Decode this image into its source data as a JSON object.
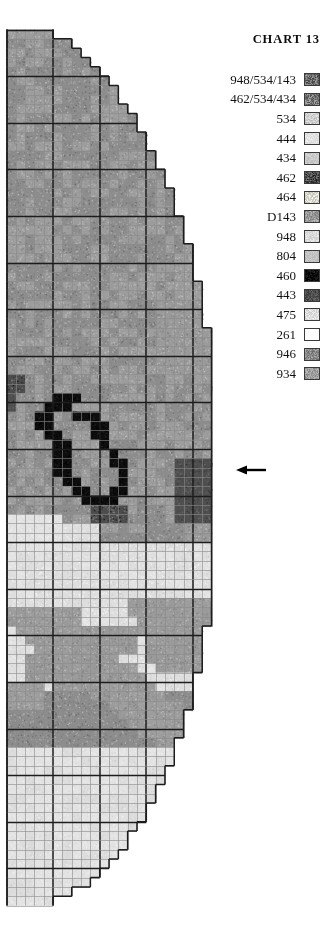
{
  "header": {
    "title": "CHART 13"
  },
  "legend": {
    "items": [
      {
        "label": "948/534/143",
        "color": "#6f6f6f",
        "noise": 0.42
      },
      {
        "label": "462/534/434",
        "color": "#7e7e7e",
        "noise": 0.4
      },
      {
        "label": "534",
        "color": "#cfcfcf",
        "noise": 0.22
      },
      {
        "label": "444",
        "color": "#e3e3e3",
        "noise": 0.1
      },
      {
        "label": "434",
        "color": "#c9c9c9",
        "noise": 0.12
      },
      {
        "label": "462",
        "color": "#4c4c4c",
        "noise": 0.42
      },
      {
        "label": "464",
        "color": "#d8d8cf",
        "noise": 0.26
      },
      {
        "label": "D143",
        "color": "#9a9a9a",
        "noise": 0.26
      },
      {
        "label": "948",
        "color": "#dcdcdc",
        "noise": 0.12
      },
      {
        "label": "804",
        "color": "#c2c2c2",
        "noise": 0.1
      },
      {
        "label": "460",
        "color": "#0d0d0d",
        "noise": 0.18
      },
      {
        "label": "443",
        "color": "#4f4f4f",
        "noise": 0.22
      },
      {
        "label": "475",
        "color": "#dedede",
        "noise": 0.16
      },
      {
        "label": "261",
        "color": "#ffffff",
        "noise": 0.0
      },
      {
        "label": "946",
        "color": "#8d8d8d",
        "noise": 0.3
      },
      {
        "label": "934",
        "color": "#9d9d9d",
        "noise": 0.24
      }
    ]
  },
  "annotation": {
    "arrow": {
      "name": "row-marker-arrow",
      "x": 236,
      "y": 470,
      "length": 30
    }
  },
  "chart_data": {
    "type": "heatmap",
    "title": "CHART 13",
    "grid": {
      "origin_x": 6.5,
      "origin_y": 29.5,
      "cell": 9.32,
      "cols": 22,
      "rows": 94,
      "major_every": 5,
      "cell_line_color": "#8a8a8a",
      "major_line_color": "#1c1c1c",
      "cell_line_width": 0.6,
      "major_line_width": 1.5
    },
    "xlabel": "",
    "ylabel": "",
    "legend_position": "top-right",
    "symbols": [
      "948/534/143",
      "462/534/434",
      "534",
      "444",
      "434",
      "462",
      "464",
      "D143",
      "948",
      "804",
      "460",
      "443",
      "475",
      "261",
      "946",
      "934"
    ],
    "palette": [
      "#6f6f6f",
      "#7e7e7e",
      "#cfcfcf",
      "#e3e3e3",
      "#c9c9c9",
      "#4c4c4c",
      "#d8d8cf",
      "#9a9a9a",
      "#dcdcdc",
      "#c2c2c2",
      "#0d0d0d",
      "#4f4f4f",
      "#dedede",
      "#ffffff",
      "#8d8d8d",
      "#9d9d9d"
    ],
    "right_edge_cols": [
      4,
      6,
      7,
      8,
      9,
      10,
      11,
      11,
      12,
      13,
      13,
      14,
      14,
      15,
      15,
      16,
      16,
      17,
      17,
      17,
      18,
      18,
      18,
      19,
      19,
      19,
      19,
      20,
      20,
      20,
      20,
      20,
      21,
      21,
      21,
      21,
      21,
      21,
      21,
      21,
      21,
      21,
      21,
      21,
      21,
      21,
      21,
      21,
      21,
      21,
      21,
      21,
      21,
      21,
      21,
      21,
      21,
      21,
      21,
      21,
      21,
      21,
      21,
      21,
      20,
      20,
      20,
      20,
      20,
      19,
      19,
      19,
      19,
      18,
      18,
      18,
      17,
      17,
      17,
      16,
      16,
      15,
      15,
      14,
      14,
      13,
      12,
      12,
      11,
      10,
      9,
      8,
      6,
      4
    ],
    "regions": [
      {
        "name": "upper-field",
        "rows": [
          0,
          36
        ],
        "fill": "946",
        "note": "even mid-grey stippled field across full width"
      },
      {
        "name": "dark-motif",
        "rows": [
          37,
          53
        ],
        "fill": "460",
        "note": "black/dark 460 scrolling motif on left-centre, rows 37-53, cols 1-13"
      },
      {
        "name": "light-band",
        "rows": [
          52,
          56
        ],
        "fill": "444",
        "note": "pale 444/475 band lower-left"
      },
      {
        "name": "pale-field",
        "rows": [
          55,
          68
        ],
        "fill": "475",
        "note": "large pale field mid-lower chart"
      },
      {
        "name": "diagonal-band",
        "rows": [
          64,
          76
        ],
        "fill": "D143",
        "note": "mid-grey diagonal sweeping band from left to right"
      },
      {
        "name": "right-dark-block",
        "rows": [
          46,
          52
        ],
        "fill": "443",
        "note": "dark block at right edge, marked by the arrow"
      },
      {
        "name": "lower-field",
        "rows": [
          76,
          94
        ],
        "fill": "444",
        "note": "pale lower point of the chart"
      }
    ],
    "cells": [
      {
        "r": 37,
        "c": 1,
        "v": "462"
      },
      {
        "r": 38,
        "c": 1,
        "v": "462"
      },
      {
        "r": 39,
        "c": 5,
        "v": "460"
      },
      {
        "r": 39,
        "c": 6,
        "v": "460"
      },
      {
        "r": 40,
        "c": 4,
        "v": "460"
      },
      {
        "r": 40,
        "c": 5,
        "v": "460"
      },
      {
        "r": 41,
        "c": 3,
        "v": "460"
      },
      {
        "r": 41,
        "c": 7,
        "v": "460"
      },
      {
        "r": 41,
        "c": 8,
        "v": "460"
      },
      {
        "r": 41,
        "c": 9,
        "v": "460"
      },
      {
        "r": 42,
        "c": 3,
        "v": "460"
      },
      {
        "r": 42,
        "c": 10,
        "v": "460"
      },
      {
        "r": 43,
        "c": 4,
        "v": "460"
      },
      {
        "r": 43,
        "c": 10,
        "v": "460"
      },
      {
        "r": 44,
        "c": 5,
        "v": "460"
      },
      {
        "r": 44,
        "c": 10,
        "v": "460"
      },
      {
        "r": 45,
        "c": 5,
        "v": "460"
      },
      {
        "r": 45,
        "c": 11,
        "v": "460"
      },
      {
        "r": 46,
        "c": 5,
        "v": "460"
      },
      {
        "r": 46,
        "c": 11,
        "v": "460"
      },
      {
        "r": 46,
        "c": 12,
        "v": "460"
      },
      {
        "r": 47,
        "c": 5,
        "v": "460"
      },
      {
        "r": 47,
        "c": 12,
        "v": "460"
      },
      {
        "r": 48,
        "c": 6,
        "v": "460"
      },
      {
        "r": 48,
        "c": 12,
        "v": "460"
      },
      {
        "r": 49,
        "c": 7,
        "v": "460"
      },
      {
        "r": 49,
        "c": 11,
        "v": "460"
      },
      {
        "r": 49,
        "c": 12,
        "v": "460"
      },
      {
        "r": 50,
        "c": 8,
        "v": "460"
      },
      {
        "r": 50,
        "c": 9,
        "v": "460"
      },
      {
        "r": 50,
        "c": 10,
        "v": "460"
      }
    ]
  }
}
